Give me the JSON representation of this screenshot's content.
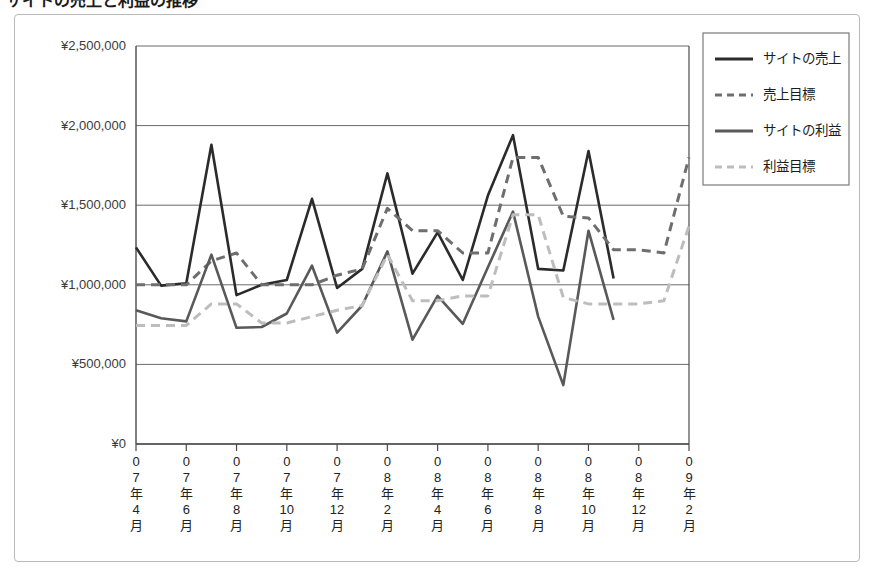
{
  "title": {
    "text": "サイトの売上と利益の推移",
    "bullet_icon": "bullet-icon"
  },
  "chart_data": {
    "type": "line",
    "title": "サイトの売上と利益の推移",
    "xlabel": "",
    "ylabel": "",
    "ylim": [
      0,
      2500000
    ],
    "ytick_values": [
      0,
      500000,
      1000000,
      1500000,
      2000000,
      2500000
    ],
    "ytick_labels": [
      "¥0",
      "¥500,000",
      "¥1,000,000",
      "¥1,500,000",
      "¥2,000,000",
      "¥2,500,000"
    ],
    "grid": true,
    "legend_position": "upper-right-outside",
    "x_major_labels": [
      "07年4月",
      "07年6月",
      "07年8月",
      "07年10月",
      "07年12月",
      "08年2月",
      "08年4月",
      "08年6月",
      "08年8月",
      "08年10月",
      "08年12月",
      "09年2月"
    ],
    "x_all_months": [
      "07年4月",
      "07年5月",
      "07年6月",
      "07年7月",
      "07年8月",
      "07年9月",
      "07年10月",
      "07年11月",
      "07年12月",
      "08年1月",
      "08年2月",
      "08年3月",
      "08年4月",
      "08年5月",
      "08年6月",
      "08年7月",
      "08年8月",
      "08年9月",
      "08年10月",
      "08年11月",
      "08年12月",
      "09年1月",
      "09年2月"
    ],
    "series": [
      {
        "name": "サイトの売上",
        "style": "solid",
        "color": "#2b2b2b",
        "width": 2.6,
        "values": [
          1235000,
          995000,
          1010000,
          1880000,
          935000,
          1000000,
          1030000,
          1540000,
          980000,
          1100000,
          1700000,
          1070000,
          1330000,
          1030000,
          1560000,
          1940000,
          1100000,
          1090000,
          1840000,
          1040000,
          null,
          null,
          null
        ]
      },
      {
        "name": "売上目標",
        "style": "dashed",
        "color": "#6e6e6e",
        "width": 3.0,
        "values": [
          1000000,
          1000000,
          1000000,
          1150000,
          1200000,
          1000000,
          1000000,
          1000000,
          1060000,
          1100000,
          1480000,
          1340000,
          1340000,
          1200000,
          1200000,
          1800000,
          1800000,
          1430000,
          1420000,
          1220000,
          1220000,
          1200000,
          1800000
        ]
      },
      {
        "name": "サイトの利益",
        "style": "solid",
        "color": "#595959",
        "width": 2.6,
        "values": [
          840000,
          790000,
          770000,
          1190000,
          730000,
          735000,
          820000,
          1120000,
          700000,
          870000,
          1210000,
          655000,
          930000,
          755000,
          1110000,
          1460000,
          800000,
          370000,
          1340000,
          780000,
          null,
          null,
          null
        ]
      },
      {
        "name": "利益目標",
        "style": "dashed",
        "color": "#bdbdbd",
        "width": 3.0,
        "values": [
          745000,
          745000,
          745000,
          880000,
          880000,
          760000,
          760000,
          800000,
          840000,
          870000,
          1190000,
          900000,
          900000,
          930000,
          930000,
          1440000,
          1440000,
          920000,
          880000,
          880000,
          880000,
          900000,
          1370000
        ]
      }
    ]
  },
  "legend": {
    "items": [
      {
        "label": "サイトの売上",
        "style": "solid",
        "color": "#2b2b2b"
      },
      {
        "label": "売上目標",
        "style": "dashed",
        "color": "#6e6e6e"
      },
      {
        "label": "サイトの利益",
        "style": "solid",
        "color": "#595959"
      },
      {
        "label": "利益目標",
        "style": "dashed",
        "color": "#bdbdbd"
      }
    ]
  },
  "colors": {
    "axis": "#4a4a4a",
    "grid": "#6b6b6b",
    "frame": "#b9b9b9",
    "text": "#2b2b2b"
  }
}
